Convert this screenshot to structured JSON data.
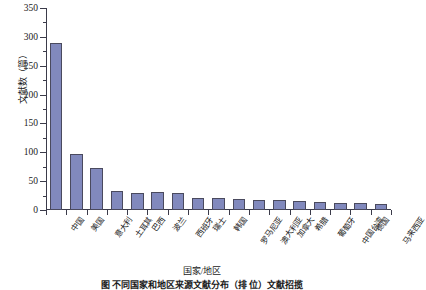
{
  "chart_data": {
    "type": "bar",
    "title": "",
    "xlabel": "国家/地区",
    "ylabel": "文献数（篇）",
    "ylim": [
      0,
      350
    ],
    "ytick_step": 50,
    "yminor_step": 25,
    "grid": false,
    "legend": null,
    "bar_color": "#8189bd",
    "bar_edge_color": "#4a4a5e",
    "axis_color": "#3b3b4a",
    "categories": [
      "中国",
      "美国",
      "意大利",
      "土耳其",
      "巴西",
      "波兰",
      "西班牙",
      "瑞士",
      "韩国",
      "罗马尼亚",
      "澳大利亚",
      "加拿大",
      "希腊",
      "葡萄牙",
      "中国台湾",
      "德国",
      "马来西亚"
    ],
    "values": [
      289,
      97,
      72,
      33,
      30,
      31,
      29,
      21,
      20,
      19,
      18,
      17,
      16,
      14,
      13,
      12,
      11
    ],
    "ytick_labels": [
      "0",
      "50",
      "100",
      "150",
      "200",
      "250",
      "300",
      "350"
    ],
    "ytick_values": [
      0,
      50,
      100,
      150,
      200,
      250,
      300,
      350
    ]
  },
  "figure": {
    "caption": "图     不同国家和地区来源文献分布（排     位）文献招揽"
  }
}
